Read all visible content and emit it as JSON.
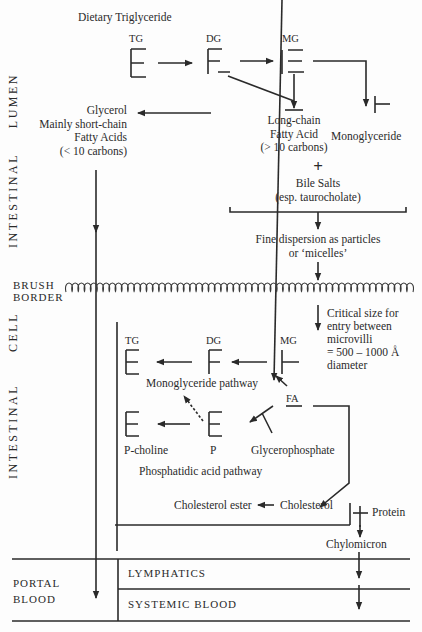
{
  "regions": {
    "lumen_label_1": "LUMEN",
    "lumen_label_2": "INTESTINAL",
    "brush_border_1": "BRUSH",
    "brush_border_2": "BORDER",
    "cell_label_1": "CELL",
    "cell_label_2": "INTESTINAL",
    "portal_blood_1": "PORTAL",
    "portal_blood_2": "BLOOD",
    "lymphatics": "LYMPHATICS",
    "systemic_blood": "SYSTEMIC BLOOD"
  },
  "lumen": {
    "title": "Dietary Triglyceride",
    "tg": "TG",
    "dg": "DG",
    "mg": "MG",
    "glycerol_lines": [
      "Glycerol",
      "Mainly short-chain",
      "Fatty Acids",
      "(< 10 carbons)"
    ],
    "long_chain_lines": [
      "Long-chain",
      "Fatty Acid",
      "(> 10 carbons)"
    ],
    "monoglyceride": "Monoglyceride",
    "plus": "+",
    "bile_salts": "Bile Salts",
    "bile_salts_note": "(esp. taurocholate)",
    "dispersion_1": "Fine dispersion as particles",
    "dispersion_2": "or ‘micelles’",
    "critical_size_lines": [
      "Critical size for",
      "entry between",
      "microvilli",
      "= 500 – 1000 Å",
      "diameter"
    ]
  },
  "cell": {
    "tg": "TG",
    "dg": "DG",
    "mg": "MG",
    "monoglyceride_pathway": "Monoglyceride pathway",
    "fa": "FA",
    "p_choline": "P-choline",
    "p": "P",
    "glycerophosphate": "Glycerophosphate",
    "phosphatidic_pathway": "Phosphatidic acid pathway",
    "cholesterol_ester": "Cholesterol ester",
    "cholesterol": "Cholesterol",
    "plus": "+",
    "protein": "Protein",
    "chylomicron": "Chylomicron"
  },
  "colors": {
    "ink": "#2a2a2a",
    "background": "#fdfdfd"
  }
}
